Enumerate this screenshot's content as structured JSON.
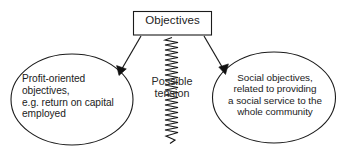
{
  "diagram": {
    "type": "relationship-diagram",
    "width": 343,
    "height": 153,
    "background_color": "#ffffff",
    "stroke_color": "#1b1b1b",
    "text_color": "#1b1b1b",
    "nodes": {
      "objectives_box": {
        "label": "Objectives",
        "shape": "rectangle"
      },
      "left_ellipse": {
        "label": "Profit-oriented\nobjectives,\ne.g. return on capital\nemployed",
        "shape": "ellipse"
      },
      "right_ellipse": {
        "label": "Social objectives,\nrelated to providing\na social service to the\nwhole community",
        "shape": "ellipse"
      }
    },
    "connectors": {
      "left_arrow": {
        "name": "arrow-to-profit-objectives",
        "style": "straight-line-with-solid-arrowhead"
      },
      "right_arrow": {
        "name": "arrow-to-social-objectives",
        "style": "straight-line-with-solid-arrowhead"
      },
      "tension_spring": {
        "label": "Possible\ntension",
        "style": "zigzag-spring"
      }
    }
  }
}
